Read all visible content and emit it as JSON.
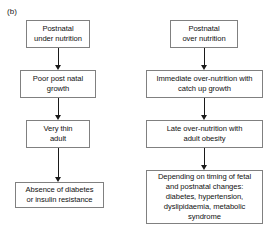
{
  "figure": {
    "panel_label": "(b)"
  },
  "columns": {
    "left": {
      "nodes": [
        {
          "id": "postnatal-under-nutrition",
          "text": "Postnatal\nunder nutrition"
        },
        {
          "id": "poor-post-natal-growth",
          "text": "Poor post natal\ngrowth"
        },
        {
          "id": "very-thin-adult",
          "text": "Very thin\nadult"
        },
        {
          "id": "absence-of-diabetes",
          "text": "Absence of diabetes\nor insulin resistance"
        }
      ]
    },
    "right": {
      "nodes": [
        {
          "id": "postnatal-over-nutrition",
          "text": "Postnatal\nover nutrition"
        },
        {
          "id": "immediate-over-nutrition",
          "text": "Immediate over-nutrition with\ncatch up growth"
        },
        {
          "id": "late-over-nutrition",
          "text": "Late over-nutrition with\nadult obesity"
        },
        {
          "id": "outcomes",
          "text": "Depending on timing of fetal\nand postnatal changes:\ndiabetes, hypertension,\ndyslipidaemia, metabolic\nsyndrome"
        }
      ]
    }
  },
  "arrows": {
    "left": [
      {
        "id": "under-to-poor",
        "from": "postnatal-under-nutrition",
        "to": "poor-post-natal-growth",
        "direction": "down"
      },
      {
        "id": "poor-to-thin",
        "from": "poor-post-natal-growth",
        "to": "very-thin-adult",
        "direction": "down"
      },
      {
        "id": "thin-to-absence",
        "from": "very-thin-adult",
        "to": "absence-of-diabetes",
        "direction": "down"
      }
    ],
    "right": [
      {
        "id": "over-to-immediate",
        "from": "postnatal-over-nutrition",
        "to": "immediate-over-nutrition",
        "direction": "down"
      },
      {
        "id": "immediate-to-late",
        "from": "immediate-over-nutrition",
        "to": "late-over-nutrition",
        "direction": "down"
      },
      {
        "id": "late-to-outcomes",
        "from": "late-over-nutrition",
        "to": "outcomes",
        "direction": "down"
      }
    ]
  },
  "colors": {
    "background": "#ffffff",
    "box_border": "#808080",
    "text": "#111111",
    "arrow": "#1a1a1a"
  }
}
